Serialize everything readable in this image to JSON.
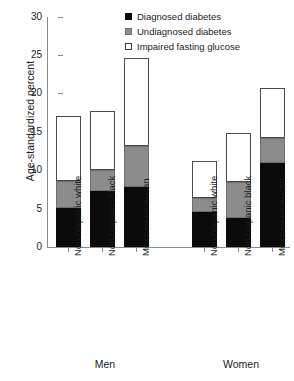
{
  "chart_data": {
    "type": "bar",
    "subtype": "stacked",
    "title": "",
    "xlabel": "",
    "ylabel": "Age-standardized percent",
    "ylim": [
      0,
      30
    ],
    "yticks": [
      0,
      5,
      10,
      15,
      20,
      25,
      30
    ],
    "ytick_labels": [
      "0",
      "5",
      "10",
      "15",
      "20",
      "25",
      "30"
    ],
    "grid": false,
    "legend_position": "top-right",
    "groups": [
      "Men",
      "Women"
    ],
    "categories": [
      "Non-hispanic white",
      "Non-hispanic black",
      "Mexican American",
      "Non-hispanic white",
      "Non-hispanic black",
      "Mexican American"
    ],
    "series": [
      {
        "name": "Diagnosed diabetes",
        "color": "#0b0b0b",
        "values": [
          5.1,
          7.3,
          7.8,
          4.6,
          3.8,
          11.0
        ]
      },
      {
        "name": "Undiagnosed diabetes",
        "color": "#8c8c8c",
        "values": [
          3.5,
          2.7,
          5.4,
          1.8,
          4.7,
          3.3
        ]
      },
      {
        "name": "Impaired fasting glucose",
        "color": "#ffffff",
        "values": [
          8.4,
          7.7,
          11.4,
          4.8,
          6.4,
          6.5
        ]
      }
    ],
    "totals": [
      17.0,
      17.7,
      24.6,
      11.2,
      14.9,
      20.8
    ],
    "bars": [
      {
        "group": "Men",
        "category": "Non-hispanic white",
        "diagnosed": 5.1,
        "undiagnosed": 3.5,
        "impaired": 8.4,
        "total": 17.0
      },
      {
        "group": "Men",
        "category": "Non-hispanic black",
        "diagnosed": 7.3,
        "undiagnosed": 2.7,
        "impaired": 7.7,
        "total": 17.7
      },
      {
        "group": "Men",
        "category": "Mexican American",
        "diagnosed": 7.8,
        "undiagnosed": 5.4,
        "impaired": 11.4,
        "total": 24.6
      },
      {
        "group": "Women",
        "category": "Non-hispanic white",
        "diagnosed": 4.6,
        "undiagnosed": 1.8,
        "impaired": 4.8,
        "total": 11.2
      },
      {
        "group": "Women",
        "category": "Non-hispanic black",
        "diagnosed": 3.8,
        "undiagnosed": 4.7,
        "impaired": 6.4,
        "total": 14.9
      },
      {
        "group": "Women",
        "category": "Mexican American",
        "diagnosed": 11.0,
        "undiagnosed": 3.3,
        "impaired": 6.5,
        "total": 20.8
      }
    ]
  },
  "legend": {
    "items": [
      {
        "label": "Diagnosed diabetes",
        "swatch": "black-square-icon"
      },
      {
        "label": "Undiagnosed diabetes",
        "swatch": "gray-square-icon"
      },
      {
        "label": "Impaired fasting glucose",
        "swatch": "white-square-icon"
      }
    ]
  },
  "axes": {
    "y_title": "Age-standardized percent",
    "y_labels": [
      "30",
      "25",
      "20",
      "15",
      "10",
      "5",
      "0"
    ]
  },
  "group_labels": [
    "Men",
    "Women"
  ]
}
